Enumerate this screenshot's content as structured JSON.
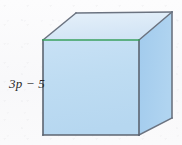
{
  "figure": {
    "kind": "cube-solid-figure",
    "label": "3p − 5",
    "label_meaning": "edge-length-expression",
    "background_color": "#fbfbfb",
    "colors": {
      "top_face": "#dceaf7",
      "front_face": "#bfdcf2",
      "right_face": "#a8cfee",
      "outline": "#5c6470",
      "outline_soft": "#7b8290",
      "highlight_edge": "#3aa15e",
      "label_text": "#2b2b2b"
    },
    "vertices": {
      "front_top_left": [
        43,
        40
      ],
      "front_top_right": [
        139,
        40
      ],
      "front_bottom_right": [
        139,
        135
      ],
      "front_bottom_left": [
        43,
        135
      ],
      "back_top_left": [
        76,
        13
      ],
      "back_top_right": [
        172,
        12
      ],
      "back_bottom_right": [
        172,
        118
      ]
    },
    "faces": {
      "top": "43,40 76,13 172,12 139,40",
      "front": "43,40 139,40 139,135 43,135",
      "right": "139,40 172,12 172,118 139,135"
    },
    "edges": {
      "front_top_highlight": [
        43,
        40,
        139,
        40
      ],
      "top_back": [
        76,
        13,
        172,
        12
      ],
      "top_left_diagonal": [
        43,
        40,
        76,
        13
      ],
      "top_right_diagonal": [
        139,
        40,
        172,
        12
      ],
      "front_left": [
        43,
        40,
        43,
        135
      ],
      "front_right": [
        139,
        40,
        139,
        135
      ],
      "front_bottom": [
        43,
        135,
        139,
        135
      ],
      "right_back_vertical": [
        172,
        12,
        172,
        118
      ],
      "right_bottom_diagonal": [
        139,
        135,
        172,
        118
      ]
    }
  }
}
